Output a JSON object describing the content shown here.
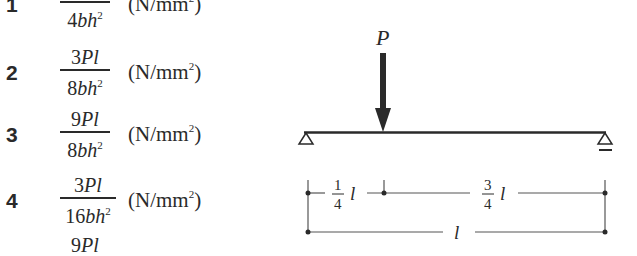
{
  "options": [
    {
      "number": "1",
      "coef": "",
      "num_var": "Pl",
      "den_coef": "4",
      "den_var": "bh",
      "exp": "2",
      "unit_open": "(N/mm",
      "unit_exp": "2",
      "unit_close": ")"
    },
    {
      "number": "2",
      "coef": "3",
      "num_var": "Pl",
      "den_coef": "8",
      "den_var": "bh",
      "exp": "2",
      "unit_open": "(N/mm",
      "unit_exp": "2",
      "unit_close": ")"
    },
    {
      "number": "3",
      "coef": "9",
      "num_var": "Pl",
      "den_coef": "8",
      "den_var": "bh",
      "exp": "2",
      "unit_open": "(N/mm",
      "unit_exp": "2",
      "unit_close": ")"
    },
    {
      "number": "4",
      "coef": "3",
      "num_var": "Pl",
      "den_coef": "16",
      "den_var": "bh",
      "exp": "2",
      "unit_open": "(N/mm",
      "unit_exp": "2",
      "unit_close": ")"
    },
    {
      "number": "5",
      "coef": "9",
      "num_var": "Pl",
      "den_coef": "",
      "den_var": "",
      "exp": "",
      "unit_open": "",
      "unit_exp": "",
      "unit_close": ""
    }
  ],
  "diagram": {
    "load_label": "P",
    "left_segment": {
      "num": "1",
      "den": "4",
      "var": "l"
    },
    "right_segment": {
      "num": "3",
      "den": "4",
      "var": "l"
    },
    "span_label": "l",
    "line_color": "#2a2a2a"
  }
}
